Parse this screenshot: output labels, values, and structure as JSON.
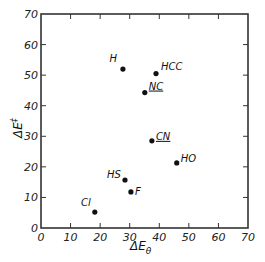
{
  "chart_data": {
    "type": "scatter",
    "title": "",
    "xlabel": "ΔEθ",
    "ylabel": "ΔE‡",
    "xlim": [
      0,
      70
    ],
    "ylim": [
      0,
      70
    ],
    "xticks": [
      0,
      10,
      20,
      30,
      40,
      50,
      60,
      70
    ],
    "yticks": [
      0,
      10,
      20,
      30,
      40,
      50,
      60,
      70
    ],
    "grid": false,
    "legend": null,
    "points": [
      {
        "label": "H",
        "x": 27.7,
        "y": 52.0
      },
      {
        "label": "HCC",
        "x": 38.9,
        "y": 50.5
      },
      {
        "label": "NC",
        "x": 35.1,
        "y": 44.3
      },
      {
        "label": "CN",
        "x": 37.5,
        "y": 28.5
      },
      {
        "label": "HO",
        "x": 45.9,
        "y": 21.3
      },
      {
        "label": "HS",
        "x": 28.4,
        "y": 15.7
      },
      {
        "label": "F",
        "x": 30.4,
        "y": 11.8
      },
      {
        "label": "Cl",
        "x": 18.2,
        "y": 5.2
      }
    ]
  },
  "colors": {
    "axis": "#333333",
    "point": "#111111"
  }
}
